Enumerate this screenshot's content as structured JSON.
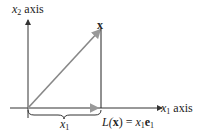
{
  "diagram": {
    "y_axis_label": {
      "var": "x",
      "sub": "2",
      "text": "axis"
    },
    "x_axis_label": {
      "var": "x",
      "sub": "1",
      "text": "axis"
    },
    "vector_label": "x",
    "brace_label": {
      "var": "x",
      "sub": "1"
    },
    "projection_label": {
      "pre": "L(",
      "bold": "x",
      "post": ") = ",
      "var": "x",
      "sub": "1",
      "e": "e",
      "e_sub": "1"
    },
    "colors": {
      "axis": "#333333",
      "vector": "#888888",
      "line": "#222222"
    }
  }
}
